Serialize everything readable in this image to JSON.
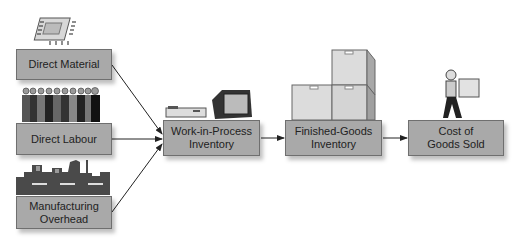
{
  "diagram": {
    "inputs": [
      {
        "id": "direct-material",
        "label_lines": [
          "Direct Material"
        ],
        "icon": "microchip-icon"
      },
      {
        "id": "direct-labour",
        "label_lines": [
          "Direct Labour"
        ],
        "icon": "workers-icon"
      },
      {
        "id": "manufacturing-overhead",
        "label_lines": [
          "Manufacturing",
          "Overhead"
        ],
        "icon": "factory-icon"
      }
    ],
    "stages": [
      {
        "id": "wip",
        "label_lines": [
          "Work-in-Process",
          "Inventory"
        ],
        "icon": "computer-icon"
      },
      {
        "id": "finished-goods",
        "label_lines": [
          "Finished-Goods",
          "Inventory"
        ],
        "icon": "boxes-icon"
      },
      {
        "id": "cogs",
        "label_lines": [
          "Cost of",
          "Goods Sold"
        ],
        "icon": "person-carrying-box-icon"
      }
    ],
    "colors": {
      "box_fill": "#a9a9a9",
      "box_border": "#6f6f6f",
      "arrow": "#222222"
    }
  }
}
